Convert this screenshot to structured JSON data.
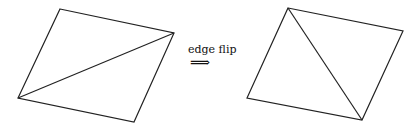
{
  "diagram": {
    "label": "edge flip",
    "arrow": "⟹",
    "stroke_color": "#222222",
    "before": {
      "vertices": {
        "top": [
          60,
          9
        ],
        "right": [
          174,
          33
        ],
        "bottom": [
          134,
          122
        ],
        "left": [
          18,
          98
        ]
      },
      "diagonal": [
        "left",
        "right"
      ]
    },
    "after": {
      "vertices": {
        "top": [
          288,
          8
        ],
        "right": [
          403,
          31
        ],
        "bottom": [
          362,
          120
        ],
        "left": [
          247,
          98
        ]
      },
      "diagonal": [
        "top",
        "bottom"
      ]
    }
  }
}
